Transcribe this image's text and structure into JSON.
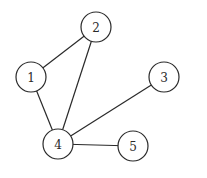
{
  "graph": {
    "type": "undirected",
    "nodes": [
      {
        "id": "1",
        "label": "1",
        "x": 31,
        "y": 77
      },
      {
        "id": "2",
        "label": "2",
        "x": 96,
        "y": 27
      },
      {
        "id": "3",
        "label": "3",
        "x": 164,
        "y": 77
      },
      {
        "id": "4",
        "label": "4",
        "x": 58,
        "y": 144
      },
      {
        "id": "5",
        "label": "5",
        "x": 133,
        "y": 146
      }
    ],
    "edges": [
      {
        "from": "1",
        "to": "2"
      },
      {
        "from": "1",
        "to": "4"
      },
      {
        "from": "2",
        "to": "4"
      },
      {
        "from": "3",
        "to": "4"
      },
      {
        "from": "4",
        "to": "5"
      }
    ],
    "node_radius": 15,
    "colors": {
      "stroke": "#2a2a2a",
      "fill": "#ffffff"
    }
  }
}
